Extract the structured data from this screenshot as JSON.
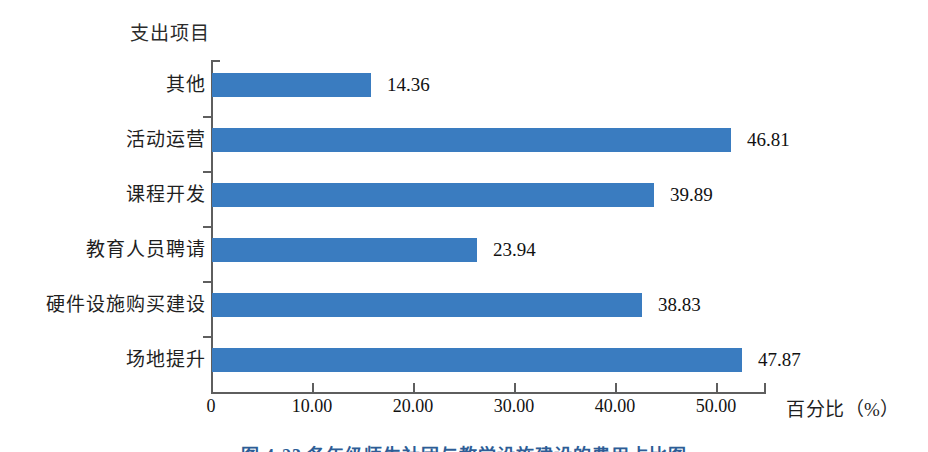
{
  "chart_data": {
    "type": "bar",
    "orientation": "horizontal",
    "title": "",
    "xlabel": "百分比（%）",
    "ylabel": "支出项目",
    "categories": [
      "场地提升",
      "硬件设施购买建设",
      "教育人员聘请",
      "课程开发",
      "活动运营",
      "其他"
    ],
    "values": [
      47.87,
      38.83,
      23.94,
      39.89,
      46.81,
      14.36
    ],
    "value_labels": [
      "47.87",
      "38.83",
      "23.94",
      "39.89",
      "46.81",
      "14.36"
    ],
    "xlim": [
      0,
      50
    ],
    "xticks": [
      0,
      10,
      20,
      30,
      40,
      50
    ],
    "xtick_labels": [
      "0",
      "10.00",
      "20.00",
      "30.00",
      "40.00",
      "50.00"
    ],
    "grid": false,
    "legend": "none",
    "series_color": "#3a7cc0",
    "axis_color": "#5e5e5e",
    "background": "#ffffff"
  },
  "axes": {
    "y_axis_title": "支出项目",
    "x_axis_title": "百分比（%）"
  },
  "caption": {
    "text": "图 4-23  各年级师生社团与教学设施建设的费用占比图"
  }
}
